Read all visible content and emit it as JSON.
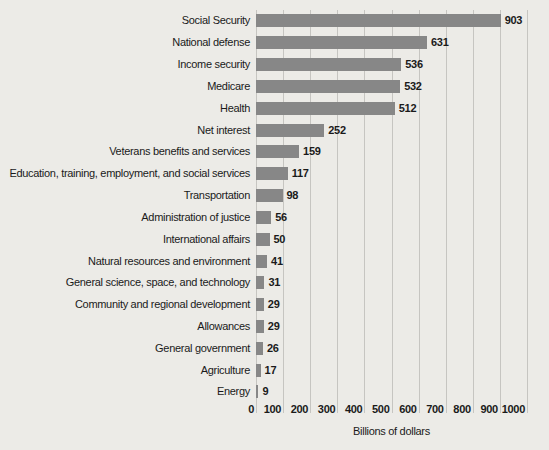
{
  "figure": {
    "background_color": "#ecebe7",
    "text_color": "#1a1a1a"
  },
  "chart_data": {
    "type": "bar",
    "orientation": "horizontal",
    "title": "",
    "xlabel": "Billions of dollars",
    "ylabel": "",
    "xlim": [
      0,
      1000
    ],
    "xticks": [
      0,
      100,
      200,
      300,
      400,
      500,
      600,
      700,
      800,
      900,
      1000
    ],
    "grid": true,
    "gridline_color": "#c6c5c1",
    "bar_color": "#878787",
    "categories": [
      "Social Security",
      "National defense",
      "Income security",
      "Medicare",
      "Health",
      "Net interest",
      "Veterans benefits and services",
      "Education, training, employment, and social services",
      "Transportation",
      "Administration of justice",
      "International affairs",
      "Natural resources and environment",
      "General science, space, and technology",
      "Community and regional development",
      "Allowances",
      "General government",
      "Agriculture",
      "Energy"
    ],
    "values": [
      903,
      631,
      536,
      532,
      512,
      252,
      159,
      117,
      98,
      56,
      50,
      41,
      31,
      29,
      29,
      26,
      17,
      9
    ],
    "value_labels": [
      "903",
      "631",
      "536",
      "532",
      "512",
      "252",
      "159",
      "117",
      "98",
      "56",
      "50",
      "41",
      "31",
      "29",
      "29",
      "26",
      "17",
      "9"
    ],
    "legend": null
  }
}
